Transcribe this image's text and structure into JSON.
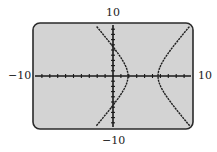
{
  "chart_data": {
    "type": "line",
    "title": "",
    "window": {
      "xmin": -10,
      "xmax": 10,
      "ymin": -10,
      "ymax": 10,
      "xscl": 1,
      "yscl": 1
    },
    "labels": {
      "top": "10",
      "bottom": "-10",
      "left": "-10",
      "right": "10"
    },
    "xlabel": "",
    "ylabel": "",
    "xlim": [
      -10,
      10
    ],
    "ylim": [
      -10,
      10
    ],
    "grid": false,
    "series": [
      {
        "name": "hyperbola",
        "equation_approx": "(x-3.8)^2/1.9^2 - y^2/3.25^2 = 1",
        "center": [
          3.8,
          0
        ],
        "a": 1.9,
        "b": 3.25,
        "vertices": [
          [
            1.9,
            0
          ],
          [
            5.7,
            0
          ]
        ],
        "y_intercepts_approx": [
          5.6,
          -5.6
        ]
      }
    ],
    "colors": {
      "screen_bg": "#d3d3d3",
      "frame": "#2a2a2a",
      "curve": "#1e1e1e",
      "axes": "#1a1a1a"
    }
  },
  "labels": {
    "top": "10",
    "bottom": "−10",
    "left": "−10",
    "right": "10"
  }
}
